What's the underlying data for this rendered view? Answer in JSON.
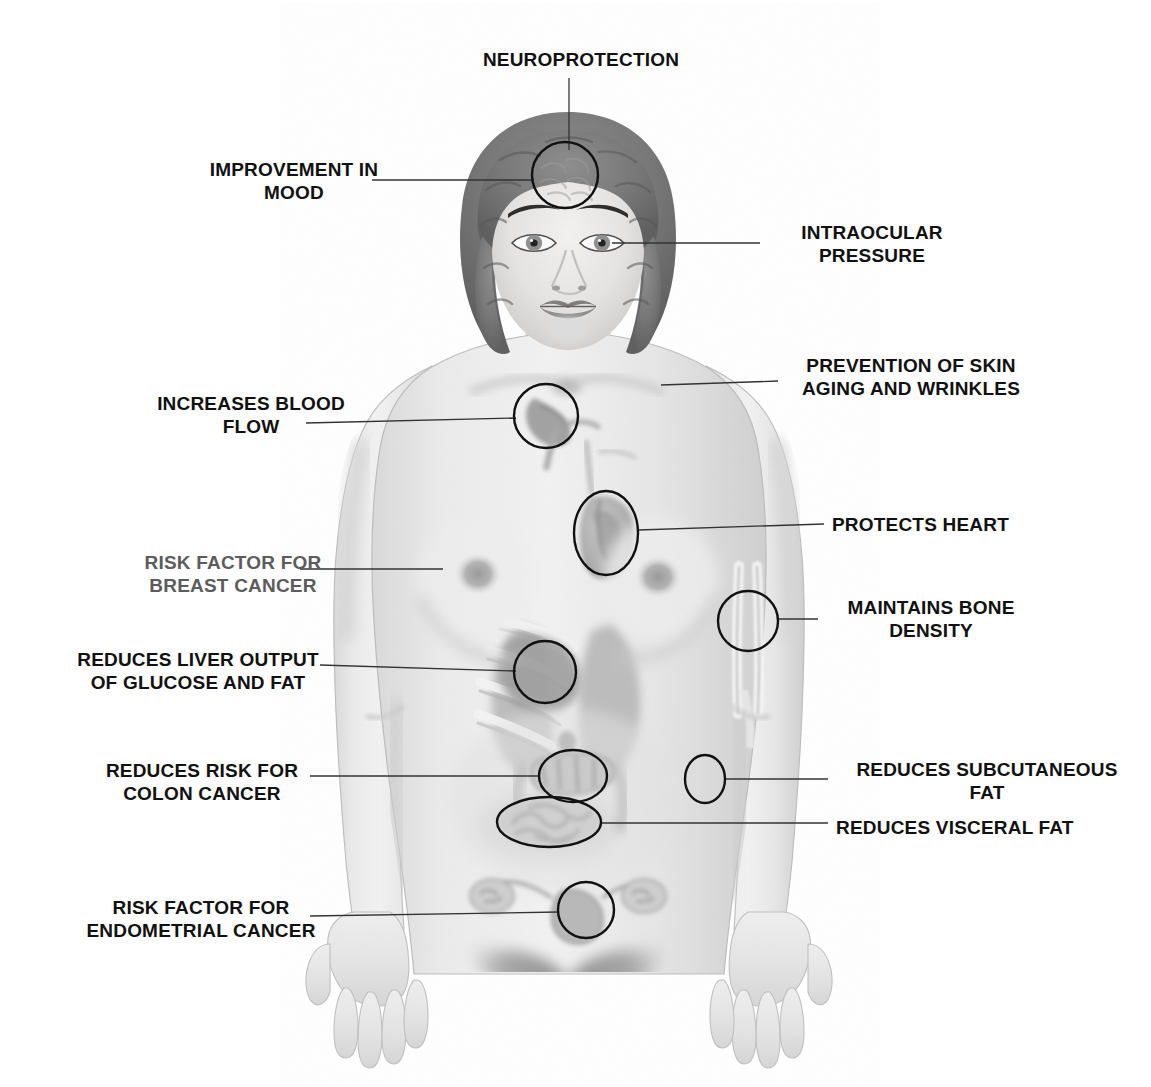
{
  "diagram": {
    "background_color": "#ffffff",
    "label_color": "#111111",
    "muted_label_color": "#5c5c5c",
    "leader_line_color": "#333333",
    "marker_circle_color": "#111111"
  },
  "labels": [
    {
      "id": "neuroprotection",
      "text": "NEUROPROTECTION",
      "align": "center",
      "tone": "dark",
      "x": 476,
      "y": 48,
      "width": 210,
      "target": "forehead-brain-circle"
    },
    {
      "id": "improvement-in-mood",
      "text": "IMPROVEMENT IN\nMOOD",
      "align": "center",
      "tone": "dark",
      "x": 186,
      "y": 158,
      "width": 216,
      "target": "forehead-brain-circle"
    },
    {
      "id": "intraocular-pressure",
      "text": "INTRAOCULAR\nPRESSURE",
      "align": "center",
      "tone": "dark",
      "x": 768,
      "y": 221,
      "width": 208,
      "target": "left-eye"
    },
    {
      "id": "prevention-of-skin-aging-and-wrinkles",
      "text": "PREVENTION OF SKIN\nAGING AND WRINKLES",
      "align": "center",
      "tone": "dark",
      "x": 784,
      "y": 354,
      "width": 254,
      "target": "shoulder-skin"
    },
    {
      "id": "increases-blood-flow",
      "text": "INCREASES BLOOD\nFLOW",
      "align": "center",
      "tone": "dark",
      "x": 140,
      "y": 392,
      "width": 222,
      "target": "upper-chest-vessels-circle"
    },
    {
      "id": "protects-heart",
      "text": "PROTECTS HEART",
      "align": "left",
      "tone": "dark",
      "x": 832,
      "y": 513,
      "width": 200,
      "target": "heart-circle"
    },
    {
      "id": "risk-factor-for-breast-cancer",
      "text": "RISK FACTOR FOR\nBREAST CANCER",
      "align": "center",
      "tone": "muted",
      "x": 120,
      "y": 551,
      "width": 226,
      "target": "right-breast"
    },
    {
      "id": "maintains-bone-density",
      "text": "MAINTAINS BONE\nDENSITY",
      "align": "center",
      "tone": "dark",
      "x": 826,
      "y": 596,
      "width": 210,
      "target": "forearm-bone-circle"
    },
    {
      "id": "reduces-liver-output-of-glucose-and-fat",
      "text": "REDUCES LIVER OUTPUT\nOF GLUCOSE AND FAT",
      "align": "center",
      "tone": "dark",
      "x": 54,
      "y": 648,
      "width": 288,
      "target": "liver-circle"
    },
    {
      "id": "reduces-risk-for-colon-cancer",
      "text": "REDUCES RISK FOR\nCOLON CANCER",
      "align": "center",
      "tone": "dark",
      "x": 90,
      "y": 759,
      "width": 224,
      "target": "colon-circle"
    },
    {
      "id": "reduces-subcutaneous-fat",
      "text": "REDUCES SUBCUTANEOUS\nFAT",
      "align": "center",
      "tone": "dark",
      "x": 836,
      "y": 758,
      "width": 302,
      "target": "hip-subcutaneous-fat-circle"
    },
    {
      "id": "reduces-visceral-fat",
      "text": "REDUCES VISCERAL FAT",
      "align": "left",
      "tone": "dark",
      "x": 836,
      "y": 816,
      "width": 256,
      "target": "visceral-fat-ellipse"
    },
    {
      "id": "risk-factor-for-endometrial-cancer",
      "text": "RISK FACTOR FOR\nENDOMETRIAL CANCER",
      "align": "center",
      "tone": "dark",
      "x": 56,
      "y": 896,
      "width": 290,
      "target": "uterus-circle"
    }
  ],
  "markers": [
    {
      "id": "forehead-brain-circle",
      "shape": "circle",
      "cx": 565,
      "cy": 175,
      "r": 33,
      "note": "brain / forehead"
    },
    {
      "id": "upper-chest-vessels-circle",
      "shape": "circle",
      "cx": 546,
      "cy": 416,
      "r": 32,
      "note": "great vessels / blood flow"
    },
    {
      "id": "heart-circle",
      "shape": "ellipse",
      "cx": 606,
      "cy": 533,
      "rx": 32,
      "ry": 42,
      "note": "heart"
    },
    {
      "id": "forearm-bone-circle",
      "shape": "circle",
      "cx": 748,
      "cy": 621,
      "r": 30,
      "note": "radius and ulna"
    },
    {
      "id": "liver-circle",
      "shape": "circle",
      "cx": 545,
      "cy": 672,
      "r": 31,
      "note": "liver"
    },
    {
      "id": "colon-circle",
      "shape": "ellipse",
      "cx": 573,
      "cy": 776,
      "rx": 34,
      "ry": 26,
      "note": "transverse colon"
    },
    {
      "id": "hip-subcutaneous-fat-circle",
      "shape": "ellipse",
      "cx": 705,
      "cy": 779,
      "rx": 20,
      "ry": 24,
      "note": "subcutaneous fat at hip"
    },
    {
      "id": "visceral-fat-ellipse",
      "shape": "ellipse",
      "cx": 549,
      "cy": 822,
      "rx": 52,
      "ry": 25,
      "note": "visceral fat / small bowel"
    },
    {
      "id": "uterus-circle",
      "shape": "circle",
      "cx": 586,
      "cy": 910,
      "r": 28,
      "note": "uterus / endometrium"
    }
  ],
  "leader_lines": [
    {
      "id": "leader-neuroprotection",
      "x1": 569,
      "y1": 78,
      "x2": 569,
      "y2": 150
    },
    {
      "id": "leader-mood",
      "x1": 372,
      "y1": 180,
      "x2": 534,
      "y2": 180
    },
    {
      "id": "leader-intraocular",
      "x1": 760,
      "y1": 243,
      "x2": 612,
      "y2": 243
    },
    {
      "id": "leader-skin",
      "x1": 778,
      "y1": 381,
      "x2": 661,
      "y2": 385
    },
    {
      "id": "leader-blood-flow",
      "x1": 306,
      "y1": 423,
      "x2": 516,
      "y2": 418
    },
    {
      "id": "leader-heart",
      "x1": 824,
      "y1": 524,
      "x2": 638,
      "y2": 530
    },
    {
      "id": "leader-breast",
      "x1": 300,
      "y1": 569,
      "x2": 443,
      "y2": 569
    },
    {
      "id": "leader-bone-density",
      "x1": 818,
      "y1": 619,
      "x2": 778,
      "y2": 619
    },
    {
      "id": "leader-liver",
      "x1": 320,
      "y1": 665,
      "x2": 516,
      "y2": 671
    },
    {
      "id": "leader-colon",
      "x1": 310,
      "y1": 776,
      "x2": 540,
      "y2": 776
    },
    {
      "id": "leader-subcutaneous-fat",
      "x1": 828,
      "y1": 779,
      "x2": 726,
      "y2": 779
    },
    {
      "id": "leader-visceral-fat",
      "x1": 828,
      "y1": 823,
      "x2": 601,
      "y2": 823
    },
    {
      "id": "leader-endometrial",
      "x1": 310,
      "y1": 916,
      "x2": 559,
      "y2": 912
    }
  ]
}
